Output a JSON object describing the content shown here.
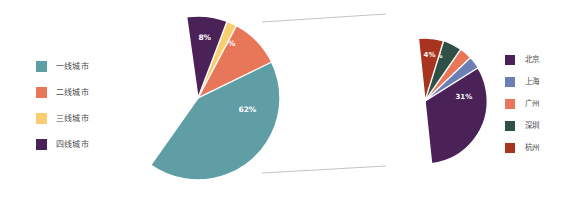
{
  "figure": {
    "background": "#ffffff",
    "width": 582,
    "height": 197
  },
  "legend_left": {
    "items": [
      {
        "label": "一线城市",
        "color": "#5f9ea5"
      },
      {
        "label": "二线城市",
        "color": "#e8775a"
      },
      {
        "label": "三线城市",
        "color": "#f9ce70"
      },
      {
        "label": "四线城市",
        "color": "#4b2258"
      }
    ]
  },
  "legend_right": {
    "items": [
      {
        "label": "北京",
        "color": "#4b2258"
      },
      {
        "label": "上海",
        "color": "#6b7fb5"
      },
      {
        "label": "广州",
        "color": "#e8775a"
      },
      {
        "label": "深圳",
        "color": "#2f4f47"
      },
      {
        "label": "杭州",
        "color": "#a8331f"
      }
    ]
  },
  "connector": {
    "color": "#b9bcc0",
    "top_line": {
      "x1": 262,
      "y1": 22,
      "x2": 386,
      "y2": 14
    },
    "bottom_line": {
      "x1": 262,
      "y1": 173,
      "x2": 386,
      "y2": 166
    }
  },
  "chart_data": [
    {
      "type": "pie",
      "name": "city-tier-distribution",
      "title": "",
      "categories": [
        "一线城市",
        "二线城市",
        "三线城市",
        "四线城市"
      ],
      "values": [
        62,
        20,
        10,
        8
      ],
      "labels": [
        "62%",
        "20%",
        "10%",
        "8%"
      ],
      "colors": [
        "#5f9ea5",
        "#e8775a",
        "#f9ce70",
        "#4b2258"
      ],
      "unit": "%",
      "start_angle": -8,
      "direction": "clockwise",
      "legend_position": "left",
      "center": {
        "x": 198,
        "y": 98
      },
      "radius": 82
    },
    {
      "type": "pie",
      "name": "tier1-city-breakdown",
      "title": "",
      "categories": [
        "北京",
        "上海",
        "广州",
        "深圳",
        "杭州"
      ],
      "values": [
        31,
        11,
        9,
        7,
        4
      ],
      "labels": [
        "31%",
        "11%",
        "9%",
        "7%",
        "4%"
      ],
      "colors": [
        "#4b2258",
        "#6b7fb5",
        "#e8775a",
        "#2f4f47",
        "#a8331f"
      ],
      "unit": "%",
      "start_angle": -6,
      "direction": "clockwise",
      "legend_position": "right",
      "center": {
        "x": 425,
        "y": 101
      },
      "radius": 63
    }
  ]
}
